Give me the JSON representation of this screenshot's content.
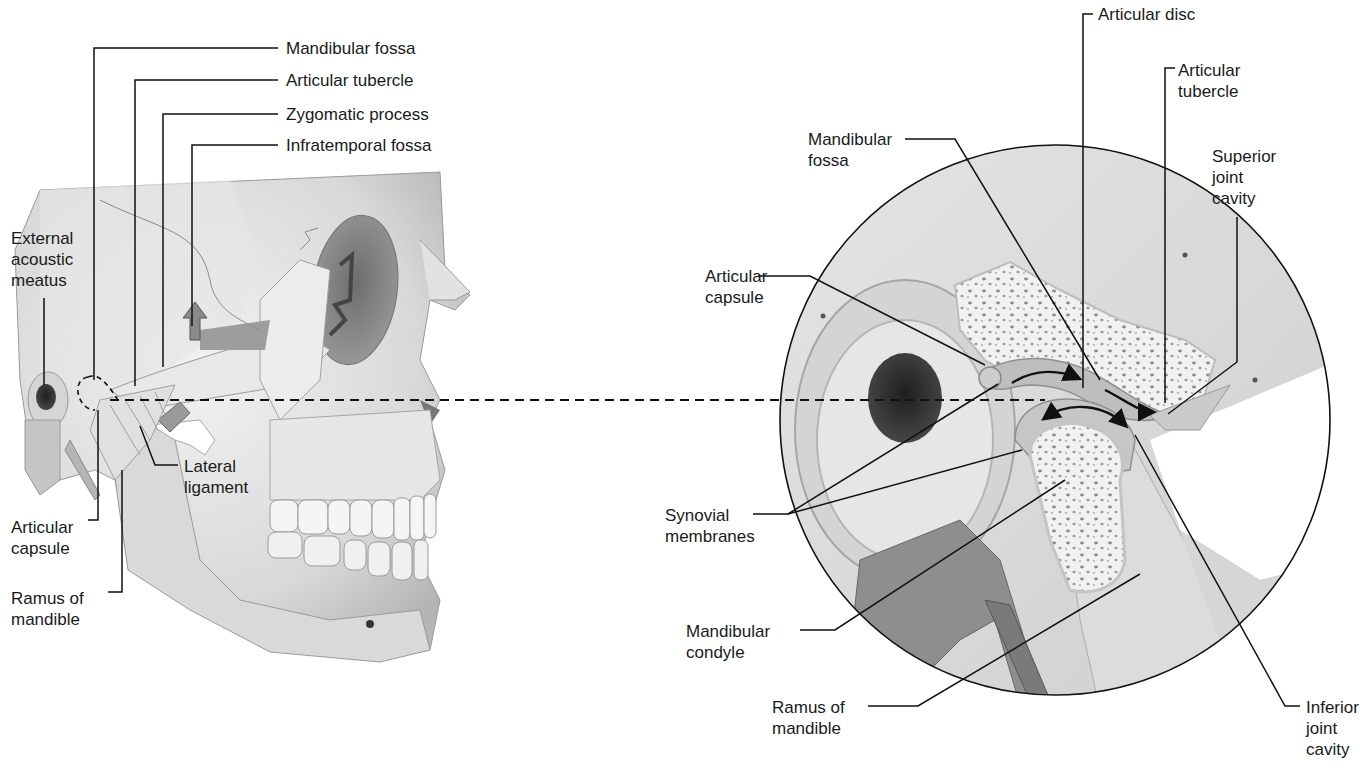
{
  "figure": {
    "left_panel": {
      "name": "Lateral view of skull",
      "labels": {
        "mandibular_fossa": "Mandibular fossa",
        "articular_tubercle": "Articular tubercle",
        "zygomatic_process": "Zygomatic process",
        "infratemporal_fossa": "Infratemporal fossa",
        "external_acoustic_meatus": "External\nacoustic\nmeatus",
        "lateral_ligament": "Lateral\nligament",
        "articular_capsule": "Articular\ncapsule",
        "ramus_of_mandible": "Ramus of\nmandible"
      }
    },
    "right_panel": {
      "name": "Sagittal section of TMJ (magnified)",
      "labels": {
        "articular_disc": "Articular disc",
        "articular_tubercle": "Articular\ntubercle",
        "mandibular_fossa": "Mandibular\nfossa",
        "superior_joint_cavity": "Superior\njoint\ncavity",
        "articular_capsule": "Articular\ncapsule",
        "synovial_membranes": "Synovial\nmembranes",
        "mandibular_condyle": "Mandibular\ncondyle",
        "ramus_of_mandible": "Ramus of\nmandible",
        "inferior_joint_cavity": "Inferior joint\ncavity"
      }
    },
    "colors": {
      "bone": "#dcdcdc",
      "bone_light": "#ececec",
      "bone_dark": "#a8a8a8",
      "cavity": "#3a3a3a",
      "leader_line": "#111111",
      "text": "#1a1a1a",
      "background": "#ffffff"
    }
  }
}
